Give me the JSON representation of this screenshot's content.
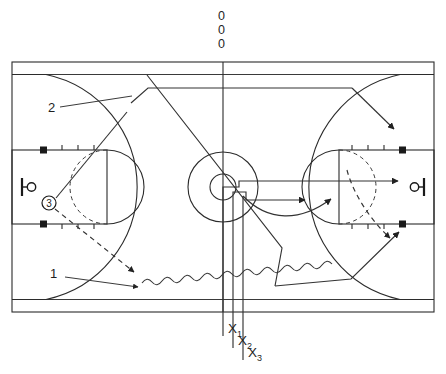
{
  "diagram": {
    "type": "basketball-play-diagram",
    "colors": {
      "line": "#2b2b2b",
      "route": "#333333",
      "fill": "#1a1a1a",
      "background": "#ffffff"
    }
  },
  "offense_labels": {
    "zero_top": "0",
    "zero_mid": "0",
    "zero_bottom": "0",
    "player_three": "3",
    "route_two": "2",
    "route_one": "1"
  },
  "defense_labels": [
    {
      "base": "X",
      "sub": "1"
    },
    {
      "base": "X",
      "sub": "2"
    },
    {
      "base": "X",
      "sub": "3"
    }
  ],
  "legend": {
    "solid_line": "cut / pass route",
    "dashed_line": "screen / defensive slide",
    "wavy_line": "dribble"
  },
  "court": {
    "outer_left": 12,
    "outer_top": 62,
    "outer_right": 434,
    "outer_bottom": 312,
    "midcourt_x": 223,
    "left_hoop_x": 32,
    "right_hoop_x": 414,
    "hoop_y": 187
  }
}
